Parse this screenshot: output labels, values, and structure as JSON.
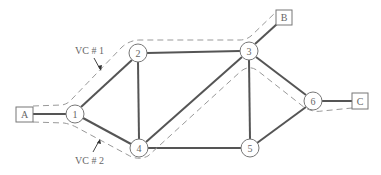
{
  "diagram": {
    "type": "network-virtual-circuits",
    "routers": [
      {
        "id": "1",
        "label": "1",
        "x": 75,
        "y": 114
      },
      {
        "id": "2",
        "label": "2",
        "x": 138,
        "y": 53
      },
      {
        "id": "3",
        "label": "3",
        "x": 249,
        "y": 51
      },
      {
        "id": "4",
        "label": "4",
        "x": 139,
        "y": 148
      },
      {
        "id": "5",
        "label": "5",
        "x": 250,
        "y": 148
      },
      {
        "id": "6",
        "label": "6",
        "x": 313,
        "y": 101
      }
    ],
    "hosts": [
      {
        "id": "A",
        "label": "A",
        "x": 24,
        "y": 114
      },
      {
        "id": "B",
        "label": "B",
        "x": 284,
        "y": 17
      },
      {
        "id": "C",
        "label": "C",
        "x": 360,
        "y": 101
      }
    ],
    "links": [
      [
        "A",
        "1"
      ],
      [
        "1",
        "2"
      ],
      [
        "1",
        "4"
      ],
      [
        "2",
        "3"
      ],
      [
        "2",
        "4"
      ],
      [
        "4",
        "3"
      ],
      [
        "4",
        "5"
      ],
      [
        "3",
        "5"
      ],
      [
        "3",
        "6"
      ],
      [
        "5",
        "6"
      ],
      [
        "3",
        "B"
      ],
      [
        "6",
        "C"
      ]
    ],
    "virtual_circuits": [
      {
        "label": "VC # 1",
        "path": [
          "A",
          "1",
          "2",
          "3",
          "B"
        ]
      },
      {
        "label": "VC # 2",
        "path": [
          "A",
          "1",
          "4",
          "3",
          "6",
          "C"
        ]
      }
    ]
  }
}
